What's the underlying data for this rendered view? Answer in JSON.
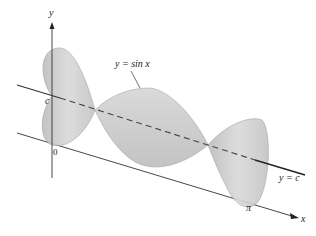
{
  "figure": {
    "type": "solid-of-revolution",
    "curve_label": "y = sin x",
    "axis_of_rotation_label": "y = c",
    "y_axis_label": "y",
    "x_axis_label": "x",
    "origin_label": "0",
    "c_label": "c",
    "pi_label": "π",
    "colors": {
      "surface": "#c9c9c9",
      "surface_dark": "#a9a9a9",
      "axis": "#333333",
      "rotation_axis": "#333333"
    }
  }
}
